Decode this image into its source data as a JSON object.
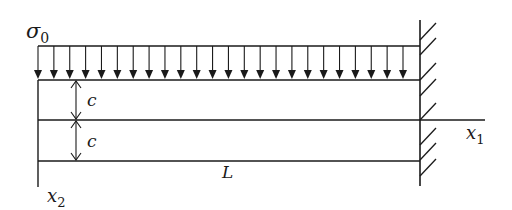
{
  "diagram": {
    "labels": {
      "load": "σ",
      "load_sub": "0",
      "half_depth_top": "c",
      "half_depth_bottom": "c",
      "length": "L",
      "axis_x": "x",
      "axis_x_sub": "1",
      "axis_y": "x",
      "axis_y_sub": "2"
    },
    "load_arrow_count": 24,
    "colors": {
      "stroke": "#1a1a1a",
      "background": "#ffffff"
    }
  }
}
